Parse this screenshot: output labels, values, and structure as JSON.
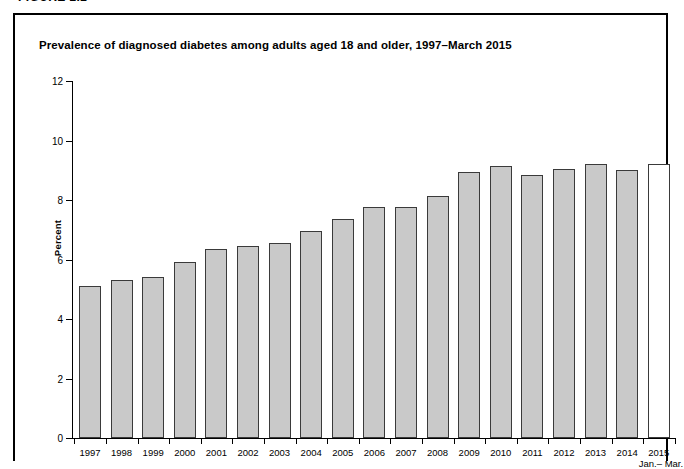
{
  "figure": {
    "label": "FIGURE 2.2",
    "title": "Prevalence of diagnosed diabetes among adults aged 18 and older, 1997–March 2015"
  },
  "chart_data": {
    "type": "bar",
    "title": "Prevalence of diagnosed diabetes among adults aged 18 and older, 1997–March 2015",
    "xlabel": "",
    "ylabel": "Percent",
    "ylim": [
      0,
      12
    ],
    "yticks": [
      0,
      2,
      4,
      6,
      8,
      10,
      12
    ],
    "grid": false,
    "legend": "none",
    "categories": [
      "1997",
      "1998",
      "1999",
      "2000",
      "2001",
      "2002",
      "2003",
      "2004",
      "2005",
      "2006",
      "2007",
      "2008",
      "2009",
      "2010",
      "2011",
      "2012",
      "2013",
      "2014",
      "2015"
    ],
    "category_sublabels": [
      "",
      "",
      "",
      "",
      "",
      "",
      "",
      "",
      "",
      "",
      "",
      "",
      "",
      "",
      "",
      "",
      "",
      "",
      "Jan.– Mar."
    ],
    "values": [
      5.1,
      5.3,
      5.4,
      5.9,
      6.35,
      6.45,
      6.55,
      6.95,
      7.35,
      7.75,
      7.75,
      8.15,
      8.95,
      9.15,
      8.85,
      9.05,
      9.2,
      9.0,
      9.2
    ],
    "bar_styles": [
      "filled",
      "filled",
      "filled",
      "filled",
      "filled",
      "filled",
      "filled",
      "filled",
      "filled",
      "filled",
      "filled",
      "filled",
      "filled",
      "filled",
      "filled",
      "filled",
      "filled",
      "filled",
      "hollow"
    ],
    "colors": {
      "bar_fill": "#c9c9c9",
      "bar_fill_partial_year": "#ffffff",
      "bar_border": "#3a3a3a",
      "axis": "#000000",
      "frame": "#000000",
      "text": "#000000"
    }
  }
}
